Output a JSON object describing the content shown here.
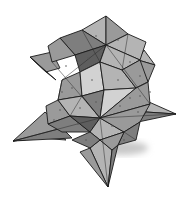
{
  "image": {
    "subject": "Pencil drawing of an origami modular star (kusudama)",
    "background": "#ffffff",
    "palette": {
      "light": "#d2d2d2",
      "mid_light": "#b4b4b4",
      "mid": "#9a9a9a",
      "mid_dark": "#7e7e7e",
      "dark": "#5e5e5e",
      "darkest": "#3c3c3c",
      "outline": "#1a1a1a"
    },
    "facets": [
      {
        "points": "13,141 45,112 62,128 40,138",
        "tone": "mid"
      },
      {
        "points": "13,141 40,138 66,140 55,132",
        "tone": "mid_light"
      },
      {
        "points": "13,141 62,128 72,138",
        "tone": "mid_dark"
      },
      {
        "points": "108,187 90,148 100,140 112,150",
        "tone": "mid_light"
      },
      {
        "points": "108,187 112,150 118,145",
        "tone": "mid_dark"
      },
      {
        "points": "90,148 108,187 80,152",
        "tone": "mid"
      },
      {
        "points": "176,114 140,98 146,112",
        "tone": "mid_light"
      },
      {
        "points": "176,114 146,112 138,122",
        "tone": "mid_dark"
      },
      {
        "points": "30,57 52,52 60,68 46,72",
        "tone": "mid"
      },
      {
        "points": "30,57 46,72 56,80",
        "tone": "mid_dark"
      },
      {
        "points": "155,65 144,50 138,60",
        "tone": "mid_light"
      },
      {
        "points": "155,65 138,60 148,82",
        "tone": "mid"
      },
      {
        "points": "106,16 82,30 106,45",
        "tone": "mid_light"
      },
      {
        "points": "106,16 106,45 128,34",
        "tone": "mid"
      },
      {
        "points": "82,30 60,38 75,55 106,45",
        "tone": "mid_dark"
      },
      {
        "points": "128,34 146,42 140,60 106,45",
        "tone": "mid_light"
      },
      {
        "points": "60,38 48,46 52,62 75,55",
        "tone": "mid"
      },
      {
        "points": "106,45 75,55 80,72 100,62",
        "tone": "dark"
      },
      {
        "points": "106,45 100,62 122,70 140,60",
        "tone": "mid_light"
      },
      {
        "points": "80,72 62,80 58,100 82,96",
        "tone": "mid"
      },
      {
        "points": "80,72 100,62 104,90 82,96",
        "tone": "light"
      },
      {
        "points": "100,62 122,70 136,88 104,90",
        "tone": "mid_light"
      },
      {
        "points": "122,70 140,60 148,82 136,88",
        "tone": "mid"
      },
      {
        "points": "58,100 46,106 48,124 70,116",
        "tone": "mid"
      },
      {
        "points": "58,100 82,96 100,118 70,116",
        "tone": "mid_light"
      },
      {
        "points": "82,96 104,90 100,118",
        "tone": "mid_dark"
      },
      {
        "points": "104,90 136,88 100,118",
        "tone": "light"
      },
      {
        "points": "136,88 148,82 150,104 100,118",
        "tone": "mid"
      },
      {
        "points": "70,116 48,124 62,132 90,132",
        "tone": "mid_dark"
      },
      {
        "points": "70,116 100,118 90,132",
        "tone": "dark"
      },
      {
        "points": "100,118 124,132 100,140 90,132",
        "tone": "mid_light"
      },
      {
        "points": "100,118 150,104 140,122 124,132",
        "tone": "mid"
      },
      {
        "points": "90,132 100,140 90,148 72,140",
        "tone": "mid_dark"
      },
      {
        "points": "124,132 140,122 136,140 118,145",
        "tone": "mid_dark"
      },
      {
        "points": "100,140 124,132 118,145 112,150",
        "tone": "mid"
      }
    ],
    "creases": [
      "M106,45 L62,80",
      "M106,45 L150,104",
      "M100,118 L52,62",
      "M100,118 L176,114",
      "M100,118 L108,187",
      "M100,118 L13,141",
      "M82,30 L100,62",
      "M128,34 L122,70",
      "M62,80 L58,100",
      "M136,88 L148,82",
      "M70,116 L82,96",
      "M124,132 L136,140"
    ],
    "dots": [
      [
        96,
        36
      ],
      [
        118,
        40
      ],
      [
        88,
        58
      ],
      [
        130,
        62
      ],
      [
        72,
        88
      ],
      [
        92,
        80
      ],
      [
        118,
        80
      ],
      [
        140,
        76
      ],
      [
        60,
        110
      ],
      [
        80,
        108
      ],
      [
        120,
        106
      ],
      [
        138,
        112
      ],
      [
        78,
        124
      ],
      [
        112,
        126
      ],
      [
        62,
        92
      ],
      [
        54,
        120
      ],
      [
        130,
        98
      ],
      [
        96,
        102
      ],
      [
        140,
        96
      ],
      [
        66,
        66
      ],
      [
        150,
        92
      ],
      [
        86,
        140
      ],
      [
        124,
        140
      ]
    ]
  }
}
